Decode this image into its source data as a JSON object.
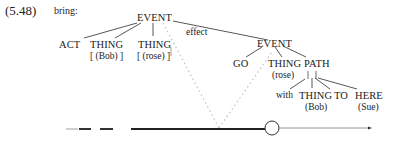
{
  "example": {
    "number": "(5.48)",
    "verb": "bring:"
  },
  "tree": {
    "root": {
      "label": "EVENT"
    },
    "act": {
      "label": "ACT"
    },
    "thing_bob": {
      "label": "THING",
      "sub": "[ (Bob) ]"
    },
    "thing_rose": {
      "label": "THING",
      "sub": "[ (rose) ]"
    },
    "effect_label": "effect",
    "event2": {
      "label": "EVENT"
    },
    "go": {
      "label": "GO"
    },
    "thing_rose2": {
      "label": "THING",
      "sub": "(rose)"
    },
    "path": {
      "label": "PATH"
    },
    "with": {
      "label": "with"
    },
    "thing_bob2": {
      "label": "THING",
      "sub": "(Bob)"
    },
    "to": {
      "label": "TO"
    },
    "here": {
      "label": "HERE",
      "sub": "(Sue)"
    }
  },
  "timeline": {
    "segments": [
      "dashed-start",
      "thick-main",
      "circle-marker",
      "thin-tail",
      "arrow-end"
    ],
    "colors": {
      "line": "#333333",
      "dotted": "#bbbbbb"
    }
  }
}
